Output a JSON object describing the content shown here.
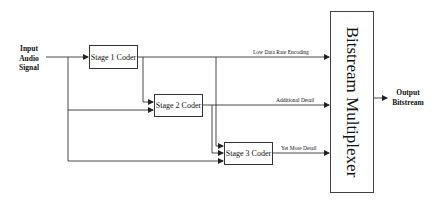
{
  "diagram": {
    "input": {
      "lines": [
        "Input",
        "Audio",
        "Signal"
      ]
    },
    "output": {
      "lines": [
        "Output",
        "Bitstream"
      ]
    },
    "stages": [
      {
        "label": "Stage 1 Coder"
      },
      {
        "label": "Stage 2 Coder"
      },
      {
        "label": "Stage 3 Coder"
      }
    ],
    "edges": [
      {
        "label": "Low Data Rate Encoding"
      },
      {
        "label": "Additional Detail"
      },
      {
        "label": "Yet More Detail"
      }
    ],
    "multiplexer": {
      "label": "Bitstream Multiplexer"
    },
    "colors": {
      "line": "#333333",
      "background": "#ffffff"
    }
  }
}
